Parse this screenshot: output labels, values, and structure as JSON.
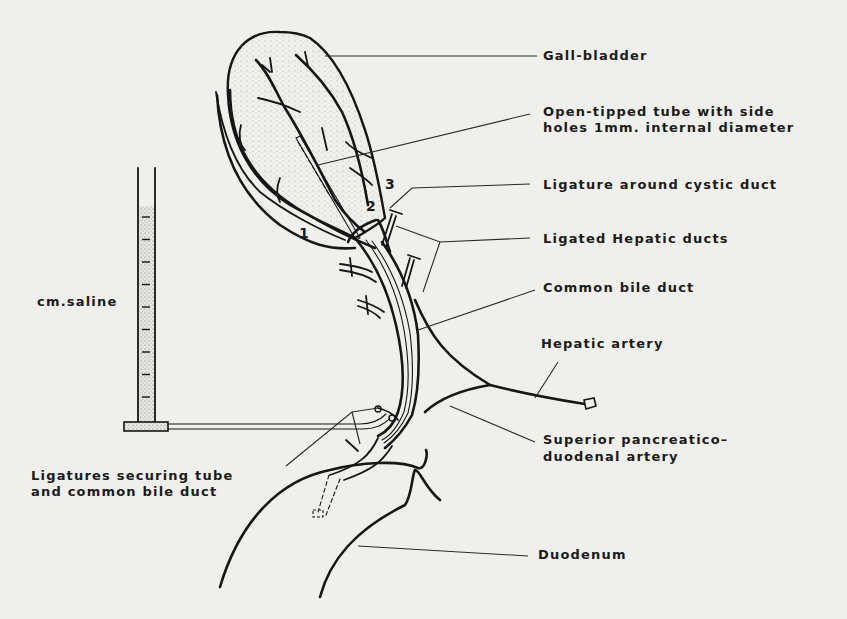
{
  "figure": {
    "labels": {
      "gall_bladder": "Gall-bladder",
      "open_tube_line1": "Open-tipped tube with side",
      "open_tube_line2": "holes 1mm. internal diameter",
      "ligature_cystic": "Ligature around cystic duct",
      "ligated_hepatic": "Ligated Hepatic ducts",
      "common_bile_duct": "Common bile duct",
      "hepatic_artery": "Hepatic artery",
      "sup_pancreatico_line1": "Superior pancreatico–",
      "sup_pancreatico_line2": "duodenal artery",
      "ligatures_securing_line1": "Ligatures securing tube",
      "ligatures_securing_line2": "and common bile duct",
      "duodenum": "Duodenum",
      "manometer": "cm.saline"
    },
    "numbers": [
      "1",
      "2",
      "3"
    ],
    "manometer": {
      "scale_ticks": 9
    }
  }
}
